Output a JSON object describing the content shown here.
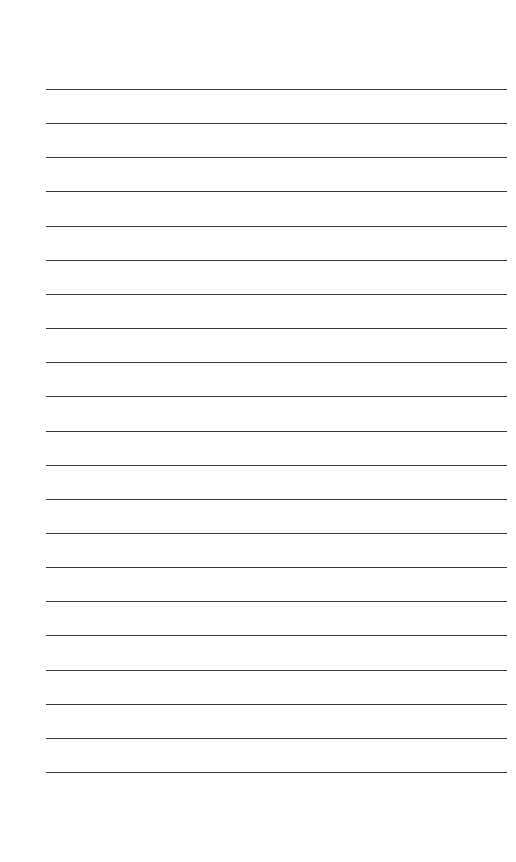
{
  "page": {
    "type": "blank-lined-sheet",
    "background_color": "#ffffff",
    "line_color": "#3a3a3a",
    "line_count": 21,
    "first_line_y": 89,
    "line_spacing": 34.15,
    "line_left": 46,
    "line_right": 507
  }
}
